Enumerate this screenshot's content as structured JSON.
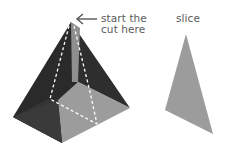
{
  "diagram": {
    "annotation": {
      "line1": "start the",
      "line2": "cut here"
    },
    "slice_label": "slice",
    "colors": {
      "dark_face": "#2c2c2c",
      "mid_face": "#3d3d3d",
      "light_face": "#9a9a9a",
      "cut_face": "#8d8d8d",
      "slice": "#9c9c9c",
      "dash": "#ffffff",
      "arrow": "#555555"
    }
  }
}
